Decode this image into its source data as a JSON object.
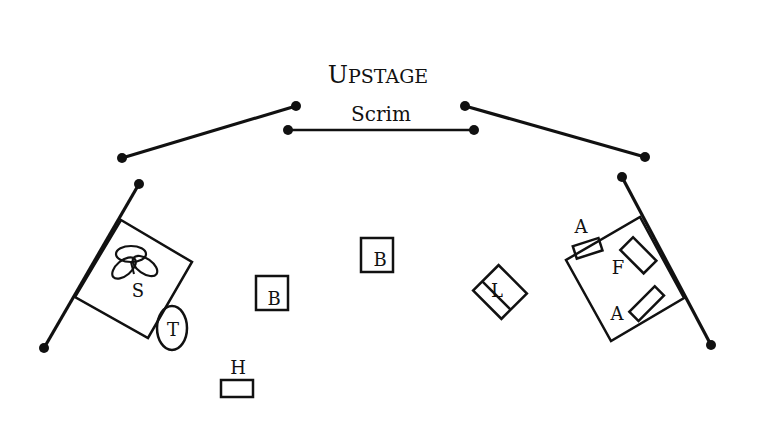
{
  "title": {
    "initial": "U",
    "rest": "PSTAGE"
  },
  "scrim": {
    "label": "Scrim"
  },
  "colors": {
    "ink": "#111111",
    "background": "#ffffff"
  },
  "labels": {
    "stool_group": "S",
    "table": "T",
    "box_center": "B",
    "box_left": "B",
    "hassock": "H",
    "lamp": "L",
    "armchair_top": "A",
    "armchair_bottom": "A",
    "footstool": "F"
  },
  "legend_semantics": {
    "S": "seating cluster",
    "T": "table",
    "B": "box",
    "H": "hassock",
    "L": "lamp",
    "A": "chair",
    "F": "furniture piece"
  }
}
